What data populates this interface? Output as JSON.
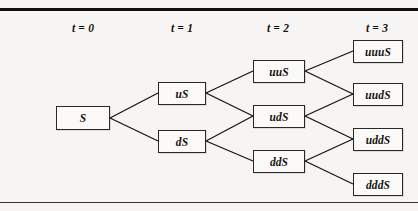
{
  "figure": {
    "kind": "binomial-lattice-diagram",
    "background_color": "#f6f5f3",
    "rule_color": "#120f0e",
    "box_fill": "#fbfaf9",
    "box_border_color": "#2a2725",
    "text_color": "#15120f"
  },
  "headers": [
    {
      "label": "t = 0",
      "x": 43
    },
    {
      "label": "t = 1",
      "x": 142
    },
    {
      "label": "t = 2",
      "x": 238
    },
    {
      "label": "t = 3",
      "x": 337
    }
  ],
  "nodes": [
    {
      "id": "n0",
      "label": "S",
      "x": 56,
      "y": 106,
      "w": 54,
      "h": 24,
      "time": 0
    },
    {
      "id": "nu",
      "label": "uS",
      "x": 158,
      "y": 82,
      "w": 48,
      "h": 23,
      "time": 1
    },
    {
      "id": "nd",
      "label": "dS",
      "x": 158,
      "y": 130,
      "w": 48,
      "h": 23,
      "time": 1
    },
    {
      "id": "nuu",
      "label": "uuS",
      "x": 253,
      "y": 60,
      "w": 52,
      "h": 23,
      "time": 2
    },
    {
      "id": "nud",
      "label": "udS",
      "x": 253,
      "y": 105,
      "w": 52,
      "h": 23,
      "time": 2
    },
    {
      "id": "ndd",
      "label": "ddS",
      "x": 253,
      "y": 150,
      "w": 52,
      "h": 23,
      "time": 2
    },
    {
      "id": "nuuu",
      "label": "uuuS",
      "x": 353,
      "y": 40,
      "w": 50,
      "h": 23,
      "time": 3
    },
    {
      "id": "nuud",
      "label": "uudS",
      "x": 353,
      "y": 83,
      "w": 50,
      "h": 23,
      "time": 3
    },
    {
      "id": "nudd",
      "label": "uddS",
      "x": 353,
      "y": 128,
      "w": 50,
      "h": 23,
      "time": 3
    },
    {
      "id": "nddd",
      "label": "dddS",
      "x": 353,
      "y": 173,
      "w": 50,
      "h": 23,
      "time": 3
    }
  ],
  "edges": [
    {
      "from": "n0",
      "to": "nu",
      "x1": 110,
      "y1": 118,
      "x2": 158,
      "y2": 93
    },
    {
      "from": "n0",
      "to": "nd",
      "x1": 110,
      "y1": 118,
      "x2": 158,
      "y2": 141
    },
    {
      "from": "nu",
      "to": "nuu",
      "x1": 206,
      "y1": 93,
      "x2": 253,
      "y2": 71
    },
    {
      "from": "nu",
      "to": "nud",
      "x1": 206,
      "y1": 93,
      "x2": 253,
      "y2": 116
    },
    {
      "from": "nd",
      "to": "nud",
      "x1": 206,
      "y1": 141,
      "x2": 253,
      "y2": 116
    },
    {
      "from": "nd",
      "to": "ndd",
      "x1": 206,
      "y1": 141,
      "x2": 253,
      "y2": 161
    },
    {
      "from": "nuu",
      "to": "nuuu",
      "x1": 305,
      "y1": 71,
      "x2": 353,
      "y2": 51
    },
    {
      "from": "nuu",
      "to": "nuud",
      "x1": 305,
      "y1": 71,
      "x2": 353,
      "y2": 94
    },
    {
      "from": "nud",
      "to": "nuud",
      "x1": 305,
      "y1": 116,
      "x2": 353,
      "y2": 94
    },
    {
      "from": "nud",
      "to": "nudd",
      "x1": 305,
      "y1": 116,
      "x2": 353,
      "y2": 139
    },
    {
      "from": "ndd",
      "to": "nudd",
      "x1": 305,
      "y1": 161,
      "x2": 353,
      "y2": 139
    },
    {
      "from": "ndd",
      "to": "nddd",
      "x1": 305,
      "y1": 161,
      "x2": 353,
      "y2": 184
    }
  ]
}
